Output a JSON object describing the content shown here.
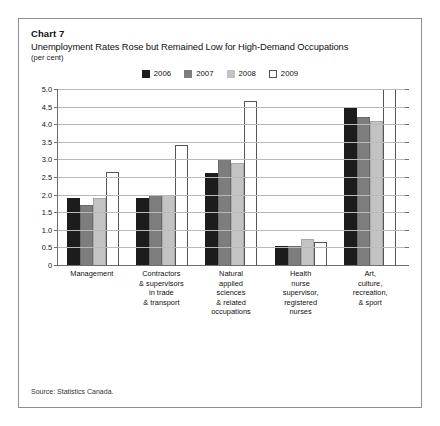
{
  "header": {
    "chart_number": "Chart 7",
    "title": "Unemployment Rates Rose but Remained Low for High-Demand Occupations",
    "units": "(per cent)"
  },
  "source": "Source: Statistics Canada.",
  "colors": {
    "y2006": "#1c1c1c",
    "y2007": "#7d7d7d",
    "y2008": "#c3c3c3",
    "y2009": "#ffffff",
    "gridline": "#b9b9b9",
    "axis": "#6d6d6d",
    "frame": "#8f8f94"
  },
  "chart_data": {
    "type": "bar",
    "title": "Unemployment Rates Rose but Remained Low for High-Demand Occupations",
    "subtitle": "Chart 7",
    "xlabel": "",
    "ylabel": "(per cent)",
    "ylim": [
      0,
      5.0
    ],
    "yticks": [
      0,
      0.5,
      1.0,
      1.5,
      2.0,
      2.5,
      3.0,
      3.5,
      4.0,
      4.5,
      5.0
    ],
    "ytick_labels": [
      "0",
      "0.5",
      "1.0",
      "1.5",
      "2.0",
      "2.5",
      "3.0",
      "3.5",
      "4.0",
      "4.5",
      "5.0"
    ],
    "grid": true,
    "legend_position": "top-center",
    "categories": [
      "Management",
      "Contractors & supervisors in trade & transport",
      "Natural applied sciences & related occupations",
      "Health nurse supervisor, registered nurses",
      "Art, culture, recreation, & sport"
    ],
    "category_lines": [
      [
        "Management"
      ],
      [
        "Contractors",
        "& supervisors",
        "in trade",
        "& transport"
      ],
      [
        "Natural",
        "applied",
        "sciences",
        "& related",
        "occupations"
      ],
      [
        "Health",
        "nurse",
        "supervisor,",
        "registered",
        "nurses"
      ],
      [
        "Art,",
        "culture,",
        "recreation,",
        "& sport"
      ]
    ],
    "series": [
      {
        "name": "2006",
        "color": "#1c1c1c",
        "values": [
          1.9,
          1.9,
          2.6,
          0.55,
          4.5
        ]
      },
      {
        "name": "2007",
        "color": "#7d7d7d",
        "values": [
          1.7,
          2.0,
          3.0,
          0.55,
          4.2
        ]
      },
      {
        "name": "2008",
        "color": "#c3c3c3",
        "values": [
          1.9,
          2.0,
          2.9,
          0.75,
          4.1
        ]
      },
      {
        "name": "2009",
        "color": "#ffffff",
        "values": [
          2.65,
          3.4,
          4.65,
          0.65,
          5.0
        ]
      }
    ]
  }
}
